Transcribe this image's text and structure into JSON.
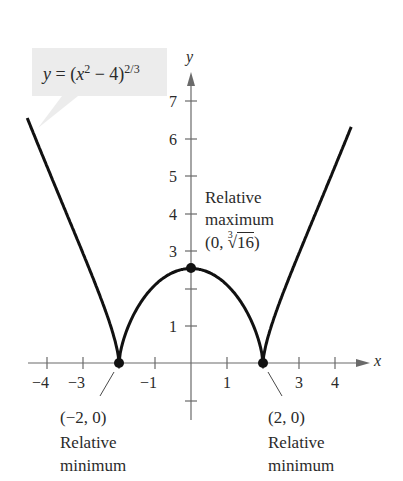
{
  "chart_data": {
    "type": "line",
    "equation_label": {
      "prefix": "y = (x",
      "sq": "2",
      "mid": " − 4)",
      "exp": "2/3"
    },
    "xlabel": "x",
    "ylabel": "y",
    "xlim": [
      -4.6,
      4.6
    ],
    "ylim": [
      -1.2,
      7.5
    ],
    "grid": false,
    "x_tick_labels": [
      "−4",
      "−3",
      "−1",
      "1",
      "3",
      "4"
    ],
    "x_tick_values": [
      -4,
      -3,
      -2,
      -1,
      1,
      2,
      3,
      4
    ],
    "y_tick_labels": [
      "7",
      "6",
      "5",
      "4",
      "3",
      "1"
    ],
    "y_tick_values": [
      7,
      6,
      5,
      4,
      3,
      2,
      1,
      -1
    ],
    "series": [
      {
        "name": "y = (x^2 - 4)^(2/3)",
        "x": [
          -4.5,
          -4,
          -3.5,
          -3,
          -2.5,
          -2.1,
          -2,
          -1.9,
          -1.5,
          -1,
          -0.5,
          0,
          0.5,
          1,
          1.5,
          1.9,
          2,
          2.1,
          2.5,
          3,
          3.5,
          4,
          4.5
        ],
        "y": [
          6.29,
          5.24,
          4.21,
          2.92,
          2.08,
          0.98,
          0,
          0.93,
          1.77,
          2.08,
          2.33,
          2.52,
          2.33,
          2.08,
          1.77,
          0.93,
          0,
          0.98,
          2.08,
          2.92,
          4.21,
          5.24,
          6.29
        ]
      }
    ],
    "points": [
      {
        "x": -2,
        "y": 0,
        "coord_label": "(−2, 0)",
        "desc_line1": "Relative",
        "desc_line2": "minimum"
      },
      {
        "x": 2,
        "y": 0,
        "coord_label": "(2, 0)",
        "desc_line1": "Relative",
        "desc_line2": "minimum"
      },
      {
        "x": 0,
        "y": 2.52,
        "coord_label_prefix": "(0, ",
        "root_index": "3",
        "radicand": "16",
        "coord_label_suffix": ")",
        "desc_line1": "Relative",
        "desc_line2": "maximum"
      }
    ]
  }
}
